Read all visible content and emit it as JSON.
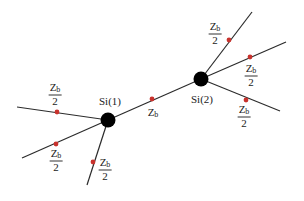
{
  "colors": {
    "line": "#2b2b2b",
    "node": "#000000",
    "marker": "#c8322d",
    "text": "#222222"
  },
  "nodes": [
    {
      "id": "si1",
      "label": "Si(1)",
      "x": 108,
      "y": 120,
      "r": 7.5,
      "label_x": 110,
      "label_y": 101
    },
    {
      "id": "si2",
      "label": "Si(2)",
      "x": 201,
      "y": 79,
      "r": 7.5,
      "label_x": 202,
      "label_y": 99
    }
  ],
  "bond": {
    "from": "si1",
    "to": "si2",
    "marker": {
      "x": 152,
      "y": 99
    },
    "label": {
      "main": "Z",
      "sub": "b",
      "x": 153,
      "y": 113
    }
  },
  "branches": [
    {
      "id": "si1-left",
      "x1": 108,
      "y1": 120,
      "x2": 17,
      "y2": 107,
      "marker": {
        "x": 57,
        "y": 112
      },
      "label": {
        "num_main": "Z",
        "num_sub": "b",
        "den": "2",
        "x": 55,
        "y": 94
      }
    },
    {
      "id": "si1-lower-left",
      "x1": 108,
      "y1": 120,
      "x2": 22,
      "y2": 158,
      "marker": {
        "x": 56,
        "y": 144
      },
      "label": {
        "num_main": "Z",
        "num_sub": "b",
        "den": "2",
        "x": 56,
        "y": 160
      }
    },
    {
      "id": "si1-down",
      "x1": 108,
      "y1": 120,
      "x2": 87,
      "y2": 185,
      "marker": {
        "x": 93,
        "y": 162
      },
      "label": {
        "num_main": "Z",
        "num_sub": "b",
        "den": "2",
        "x": 105,
        "y": 169
      }
    },
    {
      "id": "si2-up",
      "x1": 201,
      "y1": 79,
      "x2": 252,
      "y2": 12,
      "marker": {
        "x": 229,
        "y": 40
      },
      "label": {
        "num_main": "Z",
        "num_sub": "b",
        "den": "2",
        "x": 215,
        "y": 33
      }
    },
    {
      "id": "si2-right",
      "x1": 201,
      "y1": 79,
      "x2": 286,
      "y2": 42,
      "marker": {
        "x": 250,
        "y": 57
      },
      "label": {
        "num_main": "Z",
        "num_sub": "b",
        "den": "2",
        "x": 251,
        "y": 75
      }
    },
    {
      "id": "si2-lower-right",
      "x1": 201,
      "y1": 79,
      "x2": 280,
      "y2": 111,
      "marker": {
        "x": 246,
        "y": 100
      },
      "label": {
        "num_main": "Z",
        "num_sub": "b",
        "den": "2",
        "x": 244,
        "y": 116
      }
    }
  ]
}
